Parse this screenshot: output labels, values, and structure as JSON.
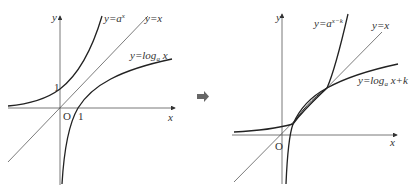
{
  "left_graph": {
    "axis_x_label": "x",
    "axis_y_label": "y",
    "origin_label": "O",
    "tick_y_label": "1",
    "tick_x_label": "1",
    "curve_exp_label_prefix": "y=a",
    "curve_exp_label_exponent": "x",
    "line_label": "y=x",
    "curve_log_label_prefix": "y=log",
    "curve_log_label_base": "a",
    "curve_log_label_suffix": " x"
  },
  "arrow": {
    "icon": "right-arrow-icon",
    "color": "#666666"
  },
  "right_graph": {
    "axis_x_label": "x",
    "axis_y_label": "y",
    "origin_label": "O",
    "curve_exp_label_prefix": "y=a",
    "curve_exp_label_exponent": "x−k",
    "line_label": "y=x",
    "curve_log_label_prefix": "y=log",
    "curve_log_label_base": "a",
    "curve_log_label_suffix": " x+k"
  }
}
